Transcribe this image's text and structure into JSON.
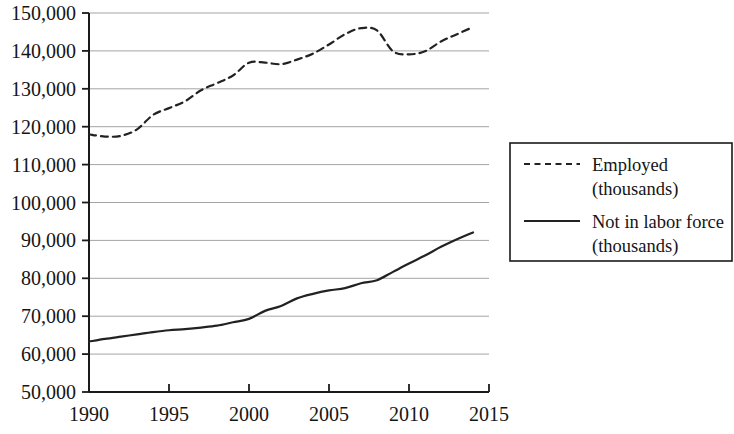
{
  "chart_data": {
    "type": "line",
    "title": "",
    "subtitle": "",
    "xlabel": "",
    "ylabel": "",
    "xlim": [
      1990,
      2015
    ],
    "ylim": [
      50000,
      150000
    ],
    "grid": true,
    "legend_position": "right",
    "x_ticks": [
      "1990",
      "1995",
      "2000",
      "2005",
      "2010",
      "2015"
    ],
    "x_tick_values": [
      1990,
      1995,
      2000,
      2005,
      2010,
      2015
    ],
    "y_ticks": [
      "50,000",
      "60,000",
      "70,000",
      "80,000",
      "90,000",
      "100,000",
      "110,000",
      "120,000",
      "130,000",
      "140,000",
      "150,000"
    ],
    "y_tick_values": [
      50000,
      60000,
      70000,
      80000,
      90000,
      100000,
      110000,
      120000,
      130000,
      140000,
      150000
    ],
    "x": [
      1990,
      1991,
      1992,
      1993,
      1994,
      1995,
      1996,
      1997,
      1998,
      1999,
      2000,
      2001,
      2002,
      2003,
      2004,
      2005,
      2006,
      2007,
      2008,
      2009,
      2010,
      2011,
      2012,
      2013,
      2014
    ],
    "series": [
      {
        "name": "Employed (thousands)",
        "style": "dashed",
        "color": "#222222",
        "values": [
          118000,
          117400,
          117600,
          119300,
          123100,
          124900,
          126700,
          129600,
          131500,
          133500,
          136900,
          136900,
          136500,
          137700,
          139300,
          141700,
          144400,
          146000,
          145400,
          139900,
          139100,
          139900,
          142500,
          144400,
          146300
        ]
      },
      {
        "name": "Not in labor force (thousands)",
        "style": "solid",
        "color": "#222222",
        "values": [
          63300,
          64000,
          64600,
          65200,
          65800,
          66300,
          66600,
          67000,
          67500,
          68400,
          69300,
          71400,
          72700,
          74700,
          75900,
          76800,
          77400,
          78700,
          79500,
          81700,
          83900,
          86000,
          88300,
          90300,
          92100
        ]
      }
    ],
    "legend": [
      {
        "line_label": "Employed",
        "unit_label": "(thousands)",
        "style": "dashed"
      },
      {
        "line_label": "Not in labor force",
        "unit_label": "(thousands)",
        "style": "solid"
      }
    ]
  }
}
